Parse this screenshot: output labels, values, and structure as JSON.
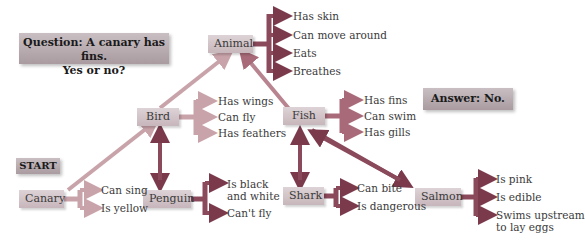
{
  "question": {
    "line1": "Question: A canary has fins.",
    "line2": "Yes or no?"
  },
  "answer": "Answer: No.",
  "start_label": "START",
  "nodes": {
    "animal": {
      "label": "Animal",
      "properties": [
        "Has skin",
        "Can move around",
        "Eats",
        "Breathes"
      ]
    },
    "bird": {
      "label": "Bird",
      "properties": [
        "Has wings",
        "Can fly",
        "Has feathers"
      ]
    },
    "fish": {
      "label": "Fish",
      "properties": [
        "Has fins",
        "Can swim",
        "Has gills"
      ]
    },
    "canary": {
      "label": "Canary",
      "properties": [
        "Can sing",
        "Is yellow"
      ]
    },
    "penguin": {
      "label": "Penguin",
      "properties": [
        "Is black",
        "and white",
        "Can't fly"
      ]
    },
    "shark": {
      "label": "Shark",
      "properties": [
        "Can bite",
        "Is dangerous"
      ]
    },
    "salmon": {
      "label": "Salmon",
      "properties": [
        "Is pink",
        "Is edible",
        "Swims upstream",
        "to lay eggs"
      ]
    }
  },
  "colors": {
    "arrow_light": "#c9a3aa",
    "arrow_mid": "#a86a78",
    "arrow_dark": "#7a3a4c"
  }
}
